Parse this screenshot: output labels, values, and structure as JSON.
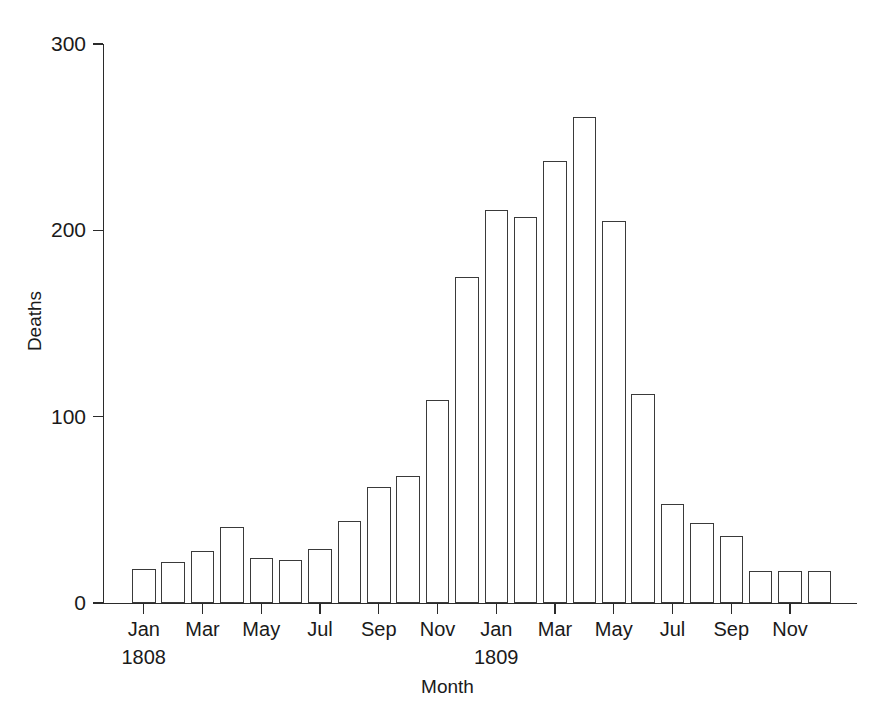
{
  "chart_data": {
    "type": "bar",
    "title": "",
    "xlabel": "Month",
    "ylabel": "Deaths",
    "ylim": [
      0,
      300
    ],
    "yticks": [
      0,
      100,
      200,
      300
    ],
    "ytick_labels": [
      "0",
      "100",
      "200",
      "300"
    ],
    "grid": false,
    "legend": "none",
    "bar_style": "open rectangles, black outline, white fill",
    "categories": [
      "Jan 1808",
      "Feb 1808",
      "Mar 1808",
      "Apr 1808",
      "May 1808",
      "Jun 1808",
      "Jul 1808",
      "Aug 1808",
      "Sep 1808",
      "Oct 1808",
      "Nov 1808",
      "Dec 1808",
      "Jan 1809",
      "Feb 1809",
      "Mar 1809",
      "Apr 1809",
      "May 1809",
      "Jun 1809",
      "Jul 1809",
      "Aug 1809",
      "Sep 1809",
      "Oct 1809",
      "Nov 1809",
      "Dec 1809"
    ],
    "values": [
      18,
      22,
      28,
      41,
      24,
      23,
      29,
      44,
      62,
      68,
      109,
      175,
      211,
      207,
      237,
      261,
      205,
      112,
      53,
      43,
      36,
      17,
      17,
      17
    ],
    "xtick_labels": [
      {
        "index": 0,
        "label": "Jan",
        "year": "1808"
      },
      {
        "index": 2,
        "label": "Mar",
        "year": ""
      },
      {
        "index": 4,
        "label": "May",
        "year": ""
      },
      {
        "index": 6,
        "label": "Jul",
        "year": ""
      },
      {
        "index": 8,
        "label": "Sep",
        "year": ""
      },
      {
        "index": 10,
        "label": "Nov",
        "year": ""
      },
      {
        "index": 12,
        "label": "Jan",
        "year": "1809"
      },
      {
        "index": 14,
        "label": "Mar",
        "year": ""
      },
      {
        "index": 16,
        "label": "May",
        "year": ""
      },
      {
        "index": 18,
        "label": "Jul",
        "year": ""
      },
      {
        "index": 20,
        "label": "Sep",
        "year": ""
      },
      {
        "index": 22,
        "label": "Nov",
        "year": ""
      }
    ]
  },
  "axes": {
    "y_title": "Deaths",
    "x_title": "Month"
  },
  "colors": {
    "axis": "#2b2b2b",
    "bar_outline": "#3a3a3a",
    "bar_fill": "#ffffff",
    "text": "#1a1a1a",
    "background": "#ffffff"
  }
}
